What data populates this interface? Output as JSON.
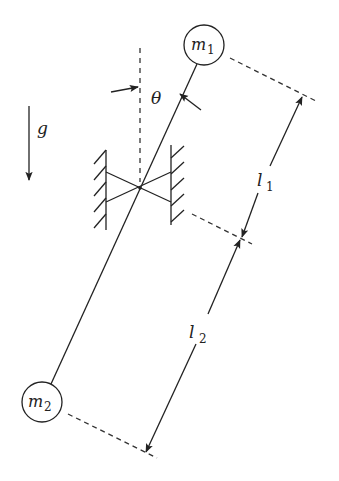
{
  "diagram": {
    "type": "double-mass pendulum with torsional pivot",
    "colors": {
      "stroke": "#222222",
      "background": "#ffffff"
    },
    "masses": [
      {
        "id": "m1",
        "symbol": "m",
        "subscript": "1",
        "cx": 204,
        "cy": 45,
        "r": 20
      },
      {
        "id": "m2",
        "symbol": "m",
        "subscript": "2",
        "cx": 42,
        "cy": 402,
        "r": 20
      }
    ],
    "labels": {
      "gravity": "g",
      "angle": "θ",
      "length1": {
        "symbol": "l",
        "subscript": "1"
      },
      "length2": {
        "symbol": "l",
        "subscript": "2"
      }
    },
    "pivot": {
      "x": 140,
      "y": 188
    }
  }
}
